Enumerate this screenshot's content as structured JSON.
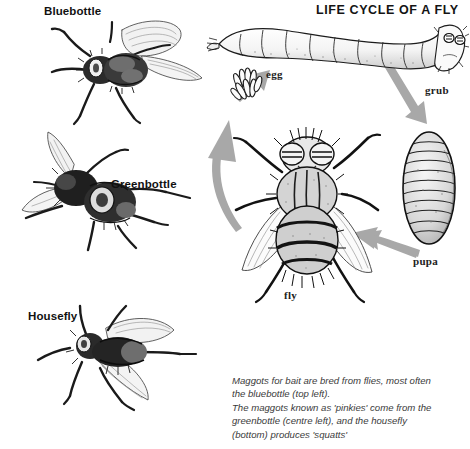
{
  "header": {
    "title": "LIFE CYCLE OF A FLY"
  },
  "specimens": [
    {
      "id": "bluebottle",
      "label": "Bluebottle",
      "icon": "bluebottle-fly-illustration"
    },
    {
      "id": "greenbottle",
      "label": "Greenbottle",
      "icon": "greenbottle-fly-illustration"
    },
    {
      "id": "housefly",
      "label": "Housefly",
      "icon": "housefly-illustration"
    }
  ],
  "cycle": {
    "stages": [
      {
        "id": "egg",
        "label": "egg",
        "icon": "fly-egg-cluster-illustration"
      },
      {
        "id": "grub",
        "label": "grub",
        "icon": "maggot-grub-illustration"
      },
      {
        "id": "pupa",
        "label": "pupa",
        "icon": "fly-pupa-illustration"
      },
      {
        "id": "fly",
        "label": "fly",
        "icon": "adult-fly-illustration"
      }
    ],
    "arrows": [
      {
        "id": "fly-to-egg",
        "from": "fly",
        "to": "egg",
        "icon": "curved-arrow-up-icon"
      },
      {
        "id": "egg-to-grub",
        "from": "egg",
        "to": "grub",
        "icon": "arrow-up-right-icon"
      },
      {
        "id": "grub-to-pupa",
        "from": "grub",
        "to": "pupa",
        "icon": "arrow-down-right-icon"
      },
      {
        "id": "pupa-to-fly",
        "from": "pupa",
        "to": "fly",
        "icon": "arrow-left-icon"
      }
    ]
  },
  "caption": {
    "line1": "Maggots for bait are bred from flies, most often",
    "line2": "the bluebottle (top left).",
    "line3": "The maggots known as 'pinkies' come from the",
    "line4": "greenbottle (centre left), and the housefly",
    "line5": "(bottom) produces 'squatts'"
  },
  "colors": {
    "background": "#ffffff",
    "ink": "#141414",
    "arrow_gray": "#a6a6a6",
    "caption_gray": "#3a3a3a"
  }
}
